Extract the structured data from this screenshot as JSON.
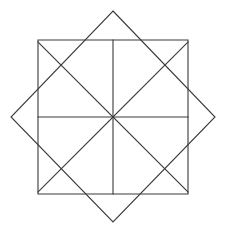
{
  "figure": {
    "background_color": "#ffffff",
    "stroke_color": "#3a3a3a",
    "stroke_width": 1.1,
    "canvas": {
      "width": 228,
      "height": 236
    },
    "center": {
      "x": 113,
      "y": 117
    },
    "shapes": [
      {
        "name": "upright-square",
        "type": "polygon",
        "points": "38,40 188,40 188,194 38,194",
        "side_length": 150,
        "rotation_deg": 0
      },
      {
        "name": "rotated-square-diamond",
        "type": "polygon",
        "points": "113,11 215,117 113,222 11,117",
        "rotation_deg": 45,
        "apexes": {
          "top": {
            "x": 113,
            "y": 11
          },
          "right": {
            "x": 215,
            "y": 117
          },
          "bottom": {
            "x": 113,
            "y": 222
          },
          "left": {
            "x": 11,
            "y": 117
          }
        }
      }
    ],
    "spokes": [
      {
        "name": "spoke-vertical-up",
        "x1": 113,
        "y1": 117,
        "x2": 113,
        "y2": 40
      },
      {
        "name": "spoke-vertical-down",
        "x1": 113,
        "y1": 117,
        "x2": 113,
        "y2": 194
      },
      {
        "name": "spoke-horizontal-left",
        "x1": 113,
        "y1": 117,
        "x2": 38,
        "y2": 117
      },
      {
        "name": "spoke-horizontal-right",
        "x1": 113,
        "y1": 117,
        "x2": 188,
        "y2": 117
      },
      {
        "name": "spoke-diagonal-up-left",
        "x1": 113,
        "y1": 117,
        "x2": 38,
        "y2": 42
      },
      {
        "name": "spoke-diagonal-up-right",
        "x1": 113,
        "y1": 117,
        "x2": 188,
        "y2": 42
      },
      {
        "name": "spoke-diagonal-down-left",
        "x1": 113,
        "y1": 117,
        "x2": 38,
        "y2": 192
      },
      {
        "name": "spoke-diagonal-down-right",
        "x1": 113,
        "y1": 117,
        "x2": 188,
        "y2": 192
      }
    ]
  }
}
